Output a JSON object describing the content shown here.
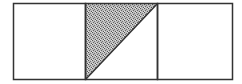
{
  "diagram": {
    "squares": [
      {
        "id": "left",
        "shaded": false
      },
      {
        "id": "middle",
        "shaded": "upper-left triangle",
        "diagonal": "bottom-left to top-right"
      },
      {
        "id": "right",
        "shaded": false
      }
    ],
    "colors": {
      "stroke": "#333333",
      "shade": "#9a9a9a",
      "background": "#ffffff"
    }
  }
}
